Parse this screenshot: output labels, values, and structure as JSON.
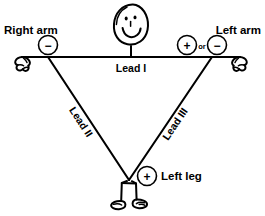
{
  "figure": {
    "background_color": "#ffffff",
    "line_color": "#000000"
  },
  "labels": {
    "right_arm": "Right arm",
    "left_arm": "Left arm",
    "left_leg": "Left leg",
    "lead_i": "Lead I",
    "lead_ii": "Lead II",
    "lead_iii": "Lead III",
    "or": "or"
  },
  "electrodes": [
    {
      "id": "right-arm-negative",
      "limb": "Right arm",
      "polarity": "-",
      "symbol": "−",
      "x": 48,
      "y": 45
    },
    {
      "id": "left-arm-positive",
      "limb": "Left arm",
      "polarity": "+",
      "symbol": "+",
      "x": 187,
      "y": 45
    },
    {
      "id": "left-arm-negative",
      "limb": "Left arm",
      "polarity": "-",
      "symbol": "−",
      "x": 217,
      "y": 45
    },
    {
      "id": "left-leg-positive",
      "limb": "Left leg",
      "polarity": "+",
      "symbol": "+",
      "x": 147,
      "y": 176
    }
  ],
  "leads": [
    {
      "name": "Lead I",
      "from": "Right arm",
      "to": "Left arm",
      "from_polarity": "-",
      "to_polarity": "+",
      "orientation": "horizontal"
    },
    {
      "name": "Lead II",
      "from": "Right arm",
      "to": "Left leg",
      "from_polarity": "-",
      "to_polarity": "+",
      "orientation": "diagonal-left"
    },
    {
      "name": "Lead III",
      "from": "Left arm",
      "to": "Left leg",
      "from_polarity": "-",
      "to_polarity": "+",
      "orientation": "diagonal-right"
    }
  ],
  "triangle_vertices": {
    "right_arm": {
      "x": 48,
      "y": 57
    },
    "left_arm": {
      "x": 212,
      "y": 57
    },
    "left_leg": {
      "x": 129,
      "y": 180
    }
  },
  "icons": {
    "head": "smiling-face-head",
    "left_hand": "right-arm-hand",
    "right_hand": "left-arm-hand",
    "feet": "shoes"
  }
}
